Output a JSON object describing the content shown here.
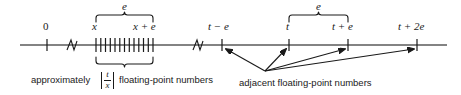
{
  "figure": {
    "axis": {
      "type": "number-line",
      "y": 45,
      "x_start": 20,
      "x_end": 447,
      "color": "#4d4d4d",
      "break_marks": [
        70,
        196
      ]
    },
    "tick_labels": [
      {
        "id": "zero",
        "text": "0",
        "x": 46,
        "upright": true
      },
      {
        "id": "x",
        "text": "x",
        "x": 95,
        "upright": false
      },
      {
        "id": "x-plus-e",
        "text": "x + e",
        "x": 143,
        "upright": false
      },
      {
        "id": "t-minus-e",
        "text": "t − e",
        "x": 220,
        "upright": false
      },
      {
        "id": "t",
        "text": "t",
        "x": 288,
        "upright": false
      },
      {
        "id": "t-plus-e",
        "text": "t + e",
        "x": 345,
        "upright": false
      },
      {
        "id": "t-plus-2e",
        "text": "t + 2e",
        "x": 412,
        "upright": false
      }
    ],
    "braces": [
      {
        "id": "upper-brace-left",
        "label": "e",
        "x_start": 96,
        "x_end": 153,
        "orientation": "up"
      },
      {
        "id": "lower-brace-left",
        "label": "",
        "x_start": 96,
        "x_end": 153,
        "orientation": "down"
      },
      {
        "id": "upper-brace-right",
        "label": "e",
        "x_start": 289,
        "x_end": 348,
        "orientation": "up"
      }
    ],
    "captions": {
      "left": {
        "prefix": "approximately",
        "fraction": {
          "numerator": "t",
          "denominator": "x",
          "absolute_value": true
        },
        "suffix": "floating-point numbers"
      },
      "right": {
        "text": "adjacent floating-point numbers"
      }
    },
    "arrow_targets": [
      {
        "id": "arrow-to-t-minus-e",
        "x": 222
      },
      {
        "id": "arrow-to-t",
        "x": 289
      },
      {
        "id": "arrow-to-t-plus-e",
        "x": 348
      },
      {
        "id": "arrow-to-t-plus-2e",
        "x": 417
      }
    ],
    "arrow_origin": {
      "x": 265,
      "y": 72
    },
    "dense_ticks": {
      "count": 13,
      "x_start": 96,
      "x_end": 153
    },
    "colors": {
      "ink": "#1a1a1a",
      "axis": "#4d4d4d",
      "background": "#ffffff"
    }
  }
}
